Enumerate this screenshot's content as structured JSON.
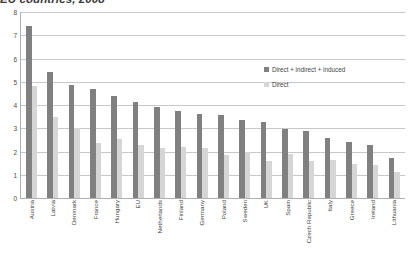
{
  "chart_data": {
    "type": "bar",
    "title": "EU countries, 2008",
    "xlabel": "",
    "ylabel": "",
    "ylim": [
      0,
      8
    ],
    "yticks": [
      0,
      1,
      2,
      3,
      4,
      5,
      6,
      7,
      8
    ],
    "grid": true,
    "legend_position": "inside-right",
    "categories": [
      "Austria",
      "Latvia",
      "Denmark",
      "France",
      "Hungary",
      "EU",
      "Netherlands",
      "Finland",
      "Germany",
      "Poland",
      "Sweden",
      "UK",
      "Spain",
      "Czech Republic",
      "Italy",
      "Greece",
      "Ireland",
      "Lithuania"
    ],
    "series": [
      {
        "name": "Direct + indirect + induced",
        "color": "#808080",
        "values": [
          7.4,
          5.4,
          4.85,
          4.7,
          4.4,
          4.15,
          3.9,
          3.75,
          3.6,
          3.55,
          3.35,
          3.25,
          2.95,
          2.9,
          2.6,
          2.4,
          2.3,
          1.7
        ]
      },
      {
        "name": "Direct",
        "color": "#d6d6d6",
        "values": [
          4.8,
          3.5,
          3.0,
          2.35,
          2.55,
          2.3,
          2.15,
          2.2,
          2.15,
          1.85,
          2.0,
          1.6,
          1.9,
          1.6,
          1.65,
          1.45,
          1.4,
          1.1
        ]
      }
    ]
  },
  "legend": {
    "items": [
      {
        "label": "Direct + indirect + induced"
      },
      {
        "label": "Direct"
      }
    ]
  }
}
